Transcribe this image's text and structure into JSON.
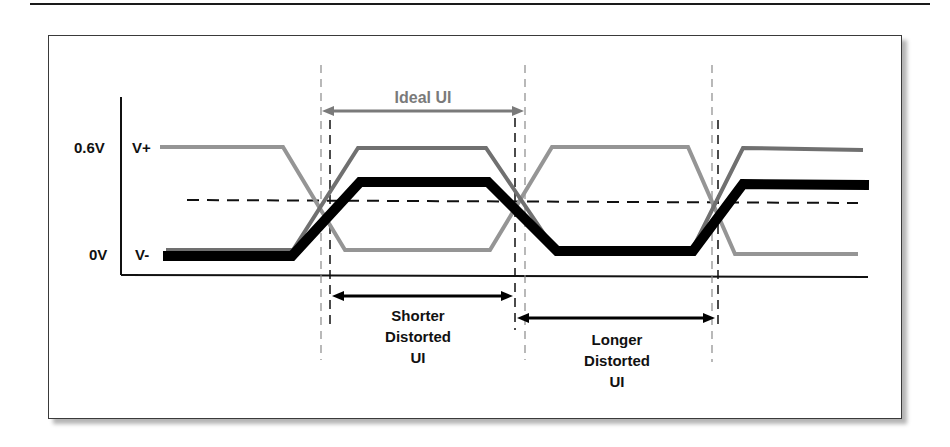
{
  "diagram": {
    "y_axis": {
      "labels": [
        {
          "text": "0.6V",
          "level": "high"
        },
        {
          "text": "0V",
          "level": "low"
        }
      ]
    },
    "signals": [
      {
        "name": "V+",
        "color": "#8c8c8c",
        "description": "Positive differential leg"
      },
      {
        "name": "V-",
        "color": "#6e6e6e",
        "description": "Negative differential leg"
      },
      {
        "name": "Single-ended (thick)",
        "color": "#000000"
      }
    ],
    "signal_labels": {
      "v_plus": "V+",
      "v_minus": "V-"
    },
    "annotations": {
      "ideal_ui": "Ideal UI",
      "shorter_line1": "Shorter",
      "shorter_line2": "Distorted",
      "shorter_line3": "UI",
      "longer_line1": "Longer",
      "longer_line2": "Distorted",
      "longer_line3": "UI"
    },
    "colors": {
      "ideal_arrow": "#7a7a7a",
      "ideal_text": "#7a7a7a",
      "distorted_arrow": "#000000",
      "frame_border": "#3a3a3a",
      "shadow": "#b5b5b5"
    }
  }
}
